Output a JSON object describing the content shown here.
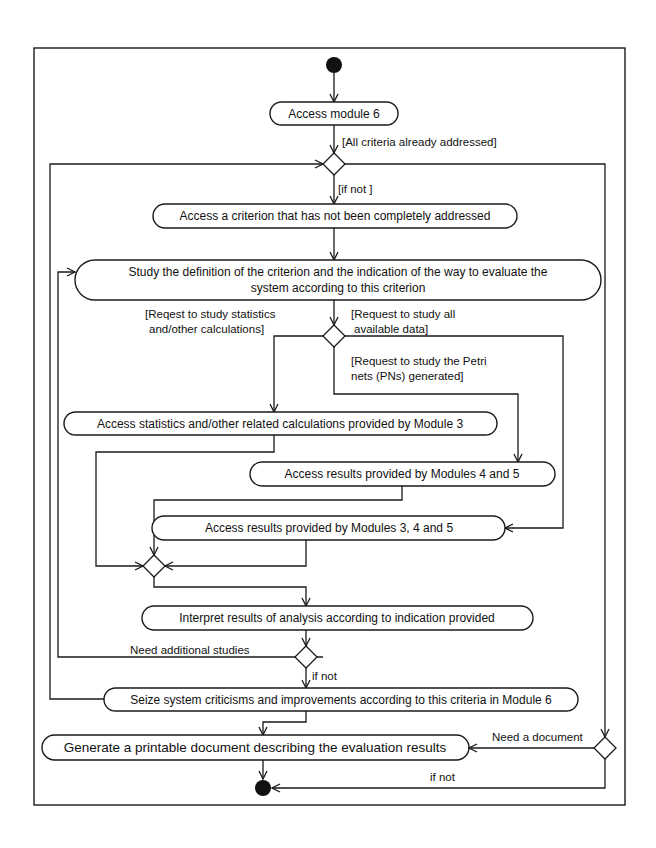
{
  "diagram": {
    "type": "UML activity diagram",
    "nodes": {
      "start": "initial-node",
      "access_module6": "Access module 6",
      "access_criterion": "Access a criterion that has not been completely addressed",
      "study_line1": "Study the definition of the criterion and the indication of the way to evaluate the",
      "study_line2": "system according to this criterion",
      "access_statistics": "Access statistics and/other related calculations provided by Module  3",
      "access_modules_45": "Access results provided by  Modules 4 and 5",
      "access_modules_345": "Access results provided by  Modules 3,  4 and 5",
      "interpret": "Interpret results of analysis according to indication provided",
      "seize": "Seize system criticisms and improvements according to this criteria in Module 6",
      "generate": "Generate a printable document describing the evaluation results",
      "end": "final-node"
    },
    "guards": {
      "all_addressed": "[All criteria already  addressed]",
      "if_not_bracket": "[if not ]",
      "stats_line1": "[Reqest to study statistics",
      "stats_line2": "and/other calculations]",
      "all_data_line1": "[Request to study all",
      "all_data_line2": "available data]",
      "petri_line1": "[Request to study the Petri",
      "petri_line2": "nets (PNs) generated]",
      "need_studies": "Need additional studies",
      "if_not_interpret": "if not",
      "need_document": "Need a document",
      "if_not_document": "if not"
    }
  }
}
